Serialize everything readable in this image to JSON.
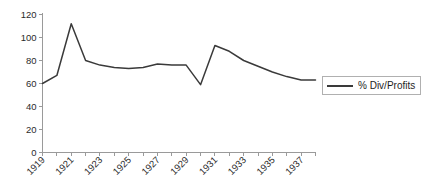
{
  "chart_data": {
    "type": "line",
    "title": "",
    "xlabel": "",
    "ylabel": "",
    "xlim": [
      1919,
      1938
    ],
    "ylim": [
      0,
      120
    ],
    "grid": false,
    "legend_position": "right",
    "y_ticks": [
      0,
      20,
      40,
      60,
      80,
      100,
      120
    ],
    "y_tick_labels": [
      "0",
      "20",
      "40",
      "60",
      "80",
      "100",
      "120"
    ],
    "x_ticks": [
      1919,
      1920,
      1921,
      1922,
      1923,
      1924,
      1925,
      1926,
      1927,
      1928,
      1929,
      1930,
      1931,
      1932,
      1933,
      1934,
      1935,
      1936,
      1937,
      1938
    ],
    "x_tick_labels": [
      "1919",
      "",
      "1921",
      "",
      "1923",
      "",
      "1925",
      "",
      "1927",
      "",
      "1929",
      "",
      "1931",
      "",
      "1933",
      "",
      "1935",
      "",
      "1937",
      ""
    ],
    "x": [
      1919,
      1920,
      1921,
      1922,
      1923,
      1924,
      1925,
      1926,
      1927,
      1928,
      1929,
      1930,
      1931,
      1932,
      1933,
      1934,
      1935,
      1936,
      1937,
      1938
    ],
    "series": [
      {
        "name": "% Div/Profits",
        "color": "#3a3a3a",
        "values": [
          60,
          67,
          112,
          80,
          76,
          74,
          73,
          74,
          77,
          76,
          76,
          59,
          93,
          88,
          80,
          75,
          70,
          66,
          63,
          63
        ]
      }
    ],
    "legend": [
      {
        "label": "% Div/Profits",
        "color": "#3a3a3a"
      }
    ]
  },
  "colors": {
    "background": "#ffffff",
    "axis": "#9a9a9a",
    "text": "#2b2b2b",
    "series": "#3a3a3a",
    "legend_border": "#b0b0b0"
  }
}
